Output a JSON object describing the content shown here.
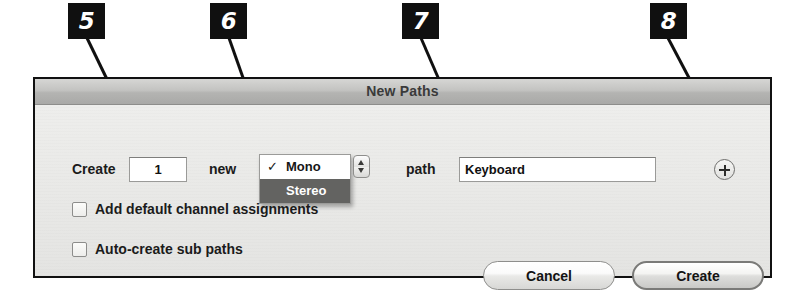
{
  "callouts": [
    {
      "id": "5",
      "label": "5"
    },
    {
      "id": "6",
      "label": "6"
    },
    {
      "id": "7",
      "label": "7"
    },
    {
      "id": "8",
      "label": "8"
    }
  ],
  "dialog": {
    "title": "New Paths",
    "row": {
      "create_label": "Create",
      "count_value": "1",
      "new_label": "new",
      "path_label": "path",
      "path_value": "Keyboard"
    },
    "channel_menu": {
      "selected": "Mono",
      "options": [
        {
          "label": "Mono",
          "checked": true,
          "highlighted": false
        },
        {
          "label": "Stereo",
          "checked": false,
          "highlighted": true
        }
      ]
    },
    "checkboxes": [
      {
        "label": "Add default channel assignments",
        "checked": false
      },
      {
        "label": "Auto-create sub paths",
        "checked": false
      }
    ],
    "buttons": {
      "cancel": "Cancel",
      "create": "Create"
    },
    "add_button_icon": "plus-icon"
  },
  "colors": {
    "badge_bg": "#101010",
    "badge_text": "#ffffff",
    "dialog_border": "#111111",
    "dialog_body_bg": "#e9e9e7",
    "titlebar_bg": "#b8b8b6",
    "menu_highlight": "#636361",
    "field_bg": "#ffffff"
  }
}
